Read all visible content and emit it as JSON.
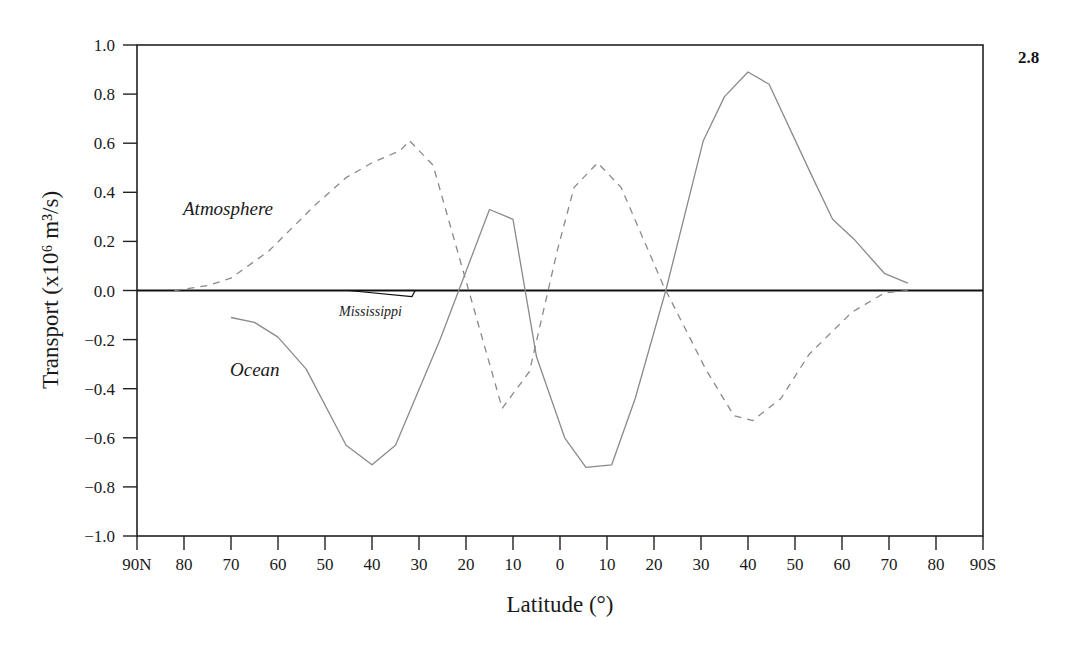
{
  "figure": {
    "number": "2.8"
  },
  "chart_data": {
    "type": "line",
    "title": "",
    "xlabel": "Latitude (°)",
    "ylabel": "Transport (x10⁶ m³/s)",
    "ylim": [
      -1.0,
      1.0
    ],
    "xlim": [
      90,
      -90
    ],
    "x_note": "positive = degrees North, negative = degrees South",
    "grid": false,
    "legend": "inline labels",
    "y_ticks": [
      "1.0",
      "0.8",
      "0.6",
      "0.4",
      "0.2",
      "0.0",
      "−0.2",
      "−0.4",
      "−0.6",
      "−0.8",
      "−1.0"
    ],
    "y_tick_values": [
      1.0,
      0.8,
      0.6,
      0.4,
      0.2,
      0.0,
      -0.2,
      -0.4,
      -0.6,
      -0.8,
      -1.0
    ],
    "x_ticks": [
      "90N",
      "80",
      "70",
      "60",
      "50",
      "40",
      "30",
      "20",
      "10",
      "0",
      "10",
      "20",
      "30",
      "40",
      "50",
      "60",
      "70",
      "80",
      "90S"
    ],
    "x_tick_values": [
      90,
      80,
      70,
      60,
      50,
      40,
      30,
      20,
      10,
      0,
      -10,
      -20,
      -30,
      -40,
      -50,
      -60,
      -70,
      -80,
      -90
    ],
    "series": [
      {
        "name": "Ocean",
        "style": "solid",
        "color": "#8a8a8a",
        "x": [
          70,
          65,
          60,
          54,
          45.5,
          40,
          35,
          25.5,
          15,
          10,
          5,
          -1,
          -5.5,
          -11,
          -16,
          -22.5,
          -30.5,
          -35,
          -40,
          -44.5,
          -53.5,
          -58,
          -62.5,
          -69,
          -74
        ],
        "values": [
          -0.11,
          -0.13,
          -0.19,
          -0.32,
          -0.63,
          -0.71,
          -0.63,
          -0.2,
          0.33,
          0.29,
          -0.27,
          -0.6,
          -0.72,
          -0.71,
          -0.44,
          0.0,
          0.61,
          0.79,
          0.89,
          0.84,
          0.47,
          0.29,
          0.21,
          0.07,
          0.03
        ]
      },
      {
        "name": "Atmosphere",
        "style": "dashed",
        "color": "#8a8a8a",
        "x": [
          82,
          75,
          70,
          62,
          52,
          45.5,
          40,
          34,
          32,
          27,
          12.3,
          6.5,
          0.5,
          -3,
          -8,
          -13,
          -22,
          -31,
          -37,
          -41,
          -47,
          -53,
          -62,
          -69,
          -74
        ],
        "values": [
          0.0,
          0.02,
          0.05,
          0.16,
          0.35,
          0.46,
          0.52,
          0.57,
          0.61,
          0.51,
          -0.48,
          -0.33,
          0.17,
          0.42,
          0.52,
          0.42,
          0.02,
          -0.32,
          -0.51,
          -0.53,
          -0.44,
          -0.26,
          -0.09,
          -0.01,
          0.0
        ]
      },
      {
        "name": "Mississippi",
        "style": "solid",
        "color": "#111111",
        "x": [
          45,
          31.5,
          30.8
        ],
        "values": [
          0.0,
          -0.025,
          0.0
        ]
      }
    ],
    "annotations": [
      {
        "text": "Atmosphere",
        "x_px": 183,
        "y_px": 215,
        "size": 19
      },
      {
        "text": "Ocean",
        "x_px": 230,
        "y_px": 376,
        "size": 19
      },
      {
        "text": "Mississippi",
        "x_px": 339,
        "y_px": 316,
        "size": 14
      }
    ]
  }
}
